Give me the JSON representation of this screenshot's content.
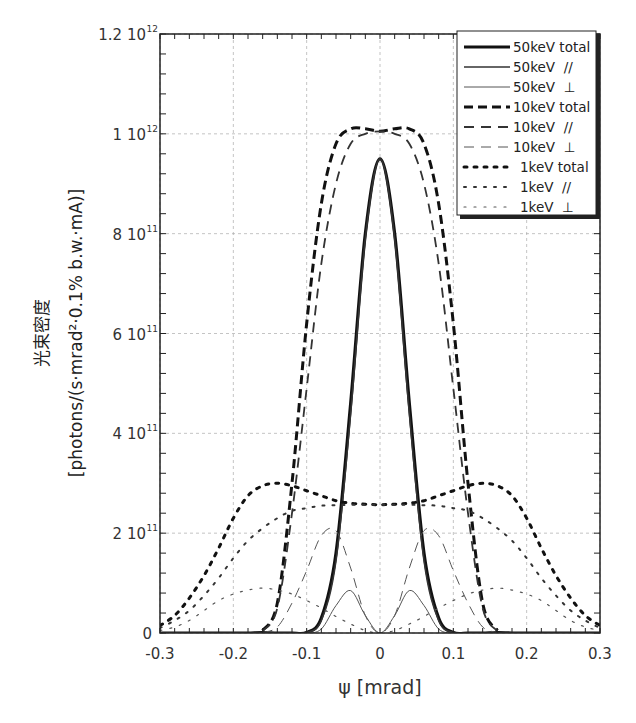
{
  "chart_data": {
    "type": "line",
    "title": "",
    "xlabel": "ψ [mrad]",
    "ylabel_line1": "光束密度",
    "ylabel_line2": "[photons/(s·mrad²·0.1% b.w.·mA)]",
    "xlim": [
      -0.3,
      0.3
    ],
    "ylim": [
      0,
      1200000000000.0
    ],
    "grid": true,
    "legend_position": "upper right",
    "x_ticks": [
      -0.3,
      -0.2,
      -0.1,
      0,
      0.1,
      0.2,
      0.3
    ],
    "x_tick_labels": [
      "-0.3",
      "-0.2",
      "-0.1",
      "0",
      "0.1",
      "0.2",
      "0.3"
    ],
    "y_ticks": [
      0,
      200000000000.0,
      400000000000.0,
      600000000000.0,
      800000000000.0,
      1000000000000.0,
      1200000000000.0
    ],
    "y_tick_labels": [
      {
        "mant": "0",
        "exp": ""
      },
      {
        "mant": "2 10",
        "exp": "11"
      },
      {
        "mant": "4 10",
        "exp": "11"
      },
      {
        "mant": "6 10",
        "exp": "11"
      },
      {
        "mant": "8 10",
        "exp": "11"
      },
      {
        "mant": "1 10",
        "exp": "12"
      },
      {
        "mant": "1.2 10",
        "exp": "12"
      }
    ],
    "x": [
      -0.3,
      -0.28,
      -0.26,
      -0.24,
      -0.22,
      -0.2,
      -0.18,
      -0.16,
      -0.14,
      -0.12,
      -0.1,
      -0.08,
      -0.06,
      -0.04,
      -0.02,
      0,
      0.02,
      0.04,
      0.06,
      0.08,
      0.1,
      0.12,
      0.14,
      0.16,
      0.18,
      0.2,
      0.22,
      0.24,
      0.26,
      0.28,
      0.3
    ],
    "series": [
      {
        "name": "50keV total",
        "style": "solid",
        "width": 3.2,
        "color": "#111111",
        "values": [
          0,
          0,
          0,
          0,
          0,
          0,
          0,
          1000000000.0,
          0,
          0,
          1000000000.0,
          30000000000.0,
          160000000000.0,
          460000000000.0,
          800000000000.0,
          950000000000.0,
          800000000000.0,
          460000000000.0,
          160000000000.0,
          30000000000.0,
          1000000000.0,
          0,
          0,
          1000000000.0,
          0,
          0,
          0,
          0,
          0,
          0,
          0
        ]
      },
      {
        "name": "50keV //",
        "style": "solid",
        "width": 1.6,
        "color": "#333333",
        "values": [
          0,
          0,
          0,
          0,
          0,
          0,
          0,
          0,
          0,
          0,
          1000000000.0,
          25000000000.0,
          145000000000.0,
          440000000000.0,
          790000000000.0,
          950000000000.0,
          790000000000.0,
          440000000000.0,
          145000000000.0,
          25000000000.0,
          1000000000.0,
          0,
          0,
          0,
          0,
          0,
          0,
          0,
          0,
          0,
          0
        ]
      },
      {
        "name": "50keV ⊥",
        "style": "solid",
        "width": 1.0,
        "color": "#555555",
        "values": [
          0,
          0,
          0,
          0,
          0,
          0,
          0,
          0,
          0,
          0,
          0,
          8000000000.0,
          55000000000.0,
          85000000000.0,
          35000000000.0,
          0,
          35000000000.0,
          85000000000.0,
          55000000000.0,
          8000000000.0,
          0,
          0,
          0,
          0,
          0,
          0,
          0,
          0,
          0,
          0,
          0
        ]
      },
      {
        "name": "10keV total",
        "style": "dash-thick",
        "width": 3.0,
        "color": "#111111",
        "values": [
          null,
          null,
          null,
          null,
          null,
          null,
          null,
          5000000000.0,
          60000000000.0,
          300000000000.0,
          620000000000.0,
          860000000000.0,
          980000000000.0,
          1010000000000.0,
          1010000000000.0,
          1005000000000.0,
          1010000000000.0,
          1010000000000.0,
          980000000000.0,
          860000000000.0,
          620000000000.0,
          300000000000.0,
          60000000000.0,
          5000000000.0,
          null,
          null,
          null,
          null,
          null,
          null,
          null
        ]
      },
      {
        "name": "10keV //",
        "style": "dash",
        "width": 1.8,
        "color": "#333333",
        "values": [
          null,
          null,
          null,
          null,
          null,
          null,
          null,
          4000000000.0,
          50000000000.0,
          240000000000.0,
          490000000000.0,
          740000000000.0,
          900000000000.0,
          980000000000.0,
          1000000000000.0,
          1005000000000.0,
          1000000000000.0,
          980000000000.0,
          900000000000.0,
          740000000000.0,
          490000000000.0,
          240000000000.0,
          50000000000.0,
          4000000000.0,
          null,
          null,
          null,
          null,
          null,
          null,
          null
        ]
      },
      {
        "name": "10keV ⊥",
        "style": "dash",
        "width": 1.0,
        "color": "#555555",
        "values": [
          null,
          null,
          null,
          null,
          null,
          null,
          null,
          1000000000.0,
          12000000000.0,
          60000000000.0,
          125000000000.0,
          195000000000.0,
          205000000000.0,
          130000000000.0,
          35000000000.0,
          0,
          35000000000.0,
          130000000000.0,
          205000000000.0,
          195000000000.0,
          125000000000.0,
          60000000000.0,
          12000000000.0,
          1000000000.0,
          null,
          null,
          null,
          null,
          null,
          null,
          null
        ]
      },
      {
        "name": "1keV total",
        "style": "dot-thick",
        "width": 3.0,
        "color": "#111111",
        "values": [
          15000000000.0,
          35000000000.0,
          70000000000.0,
          115000000000.0,
          170000000000.0,
          230000000000.0,
          275000000000.0,
          295000000000.0,
          300000000000.0,
          295000000000.0,
          285000000000.0,
          275000000000.0,
          265000000000.0,
          260000000000.0,
          258000000000.0,
          257000000000.0,
          258000000000.0,
          260000000000.0,
          265000000000.0,
          275000000000.0,
          285000000000.0,
          295000000000.0,
          300000000000.0,
          295000000000.0,
          275000000000.0,
          230000000000.0,
          170000000000.0,
          115000000000.0,
          70000000000.0,
          35000000000.0,
          15000000000.0
        ]
      },
      {
        "name": "1keV //",
        "style": "dot",
        "width": 2.0,
        "color": "#333333",
        "values": [
          10000000000.0,
          25000000000.0,
          45000000000.0,
          75000000000.0,
          110000000000.0,
          150000000000.0,
          185000000000.0,
          210000000000.0,
          230000000000.0,
          245000000000.0,
          250000000000.0,
          255000000000.0,
          256000000000.0,
          257000000000.0,
          257000000000.0,
          257000000000.0,
          257000000000.0,
          257000000000.0,
          256000000000.0,
          255000000000.0,
          250000000000.0,
          245000000000.0,
          230000000000.0,
          210000000000.0,
          185000000000.0,
          150000000000.0,
          110000000000.0,
          75000000000.0,
          45000000000.0,
          25000000000.0,
          10000000000.0
        ]
      },
      {
        "name": "1keV ⊥",
        "style": "dot",
        "width": 1.2,
        "color": "#555555",
        "values": [
          5000000000.0,
          12000000000.0,
          25000000000.0,
          45000000000.0,
          65000000000.0,
          78000000000.0,
          86000000000.0,
          90000000000.0,
          86000000000.0,
          78000000000.0,
          65000000000.0,
          50000000000.0,
          33000000000.0,
          18000000000.0,
          5000000000.0,
          0,
          5000000000.0,
          18000000000.0,
          33000000000.0,
          50000000000.0,
          65000000000.0,
          78000000000.0,
          86000000000.0,
          90000000000.0,
          86000000000.0,
          78000000000.0,
          65000000000.0,
          45000000000.0,
          25000000000.0,
          12000000000.0,
          5000000000.0
        ]
      }
    ]
  },
  "legend": {
    "items": [
      {
        "label": "50keV total"
      },
      {
        "label": "50keV  //"
      },
      {
        "label": "50keV  ⊥"
      },
      {
        "label": "10keV total"
      },
      {
        "label": "10keV  //"
      },
      {
        "label": "10keV  ⊥"
      },
      {
        "label": "1keV total"
      },
      {
        "label": "1keV  //"
      },
      {
        "label": "1keV  ⊥"
      }
    ]
  }
}
